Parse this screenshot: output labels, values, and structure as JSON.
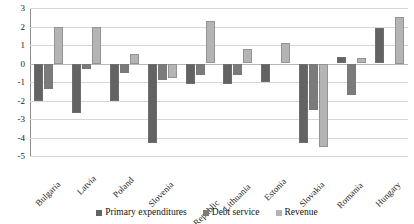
{
  "chart_data": {
    "type": "bar",
    "title": "",
    "subtitle": "",
    "xlabel": "",
    "ylabel": "",
    "ylim": [
      -5,
      3
    ],
    "yticks": [
      3,
      2,
      1,
      0,
      -1,
      -2,
      -3,
      -4,
      -5
    ],
    "ytick_labels": [
      "3",
      "2",
      "1",
      "0",
      "-1",
      "-2",
      "-3",
      "-4",
      "-5"
    ],
    "grid": true,
    "legend_position": "bottom",
    "categories": [
      "Bulgaria",
      "Latvia",
      "Poland",
      "Slovenia",
      "Czech Republic",
      "Lithuania",
      "Estonia",
      "Slovakia",
      "Romania",
      "Hungary"
    ],
    "series": [
      {
        "name": "Primary expenditures",
        "color": "#636363",
        "values": [
          -2.0,
          -2.7,
          -2.0,
          -4.3,
          -1.1,
          -1.1,
          -1.0,
          -4.3,
          0.35,
          1.9
        ]
      },
      {
        "name": "Debt service",
        "color": "#7b7b7b",
        "values": [
          -1.4,
          -0.3,
          -0.5,
          -0.9,
          -0.6,
          -0.6,
          0.0,
          -2.5,
          -1.7,
          0.0
        ]
      },
      {
        "name": "Revenue",
        "color": "#b4b4b4",
        "values": [
          2.0,
          2.0,
          0.5,
          -0.8,
          2.3,
          0.8,
          1.1,
          -4.5,
          0.3,
          2.5
        ]
      }
    ]
  }
}
